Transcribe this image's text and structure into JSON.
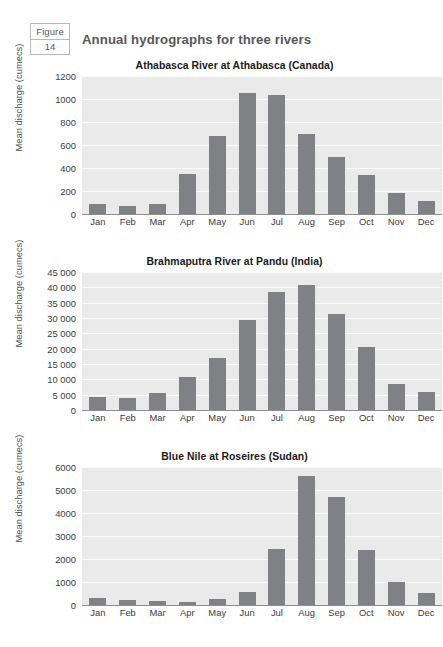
{
  "header": {
    "badge_label": "Figure",
    "badge_number": "14",
    "title": "Annual hydrographs for three rivers"
  },
  "colors": {
    "bar": "#808184",
    "plot_background": "#eaeaea",
    "gridline": "#fbfbfb",
    "axis": "#8d8d8f",
    "page_background": "#ffffff",
    "header_text": "#58585a"
  },
  "chart_data": [
    {
      "type": "bar",
      "title": "Athabasca River at Athabasca (Canada)",
      "xlabel": "",
      "ylabel": "Mean discharge (cumecs)",
      "categories": [
        "Jan",
        "Feb",
        "Mar",
        "Apr",
        "May",
        "Jun",
        "Jul",
        "Aug",
        "Sep",
        "Oct",
        "Nov",
        "Dec"
      ],
      "values": [
        85,
        70,
        90,
        345,
        680,
        1050,
        1035,
        700,
        500,
        340,
        180,
        115
      ],
      "ylim": [
        0,
        1200
      ],
      "yticks": [
        0,
        200,
        400,
        600,
        800,
        1000,
        1200
      ],
      "ytick_labels": [
        "0",
        "200",
        "400",
        "600",
        "800",
        "1000",
        "1200"
      ],
      "grid": true,
      "legend": "none"
    },
    {
      "type": "bar",
      "title": "Brahmaputra River at Pandu (India)",
      "xlabel": "",
      "ylabel": "Mean discharge (cumecs)",
      "categories": [
        "Jan",
        "Feb",
        "Mar",
        "Apr",
        "May",
        "Jun",
        "Jul",
        "Aug",
        "Sep",
        "Oct",
        "Nov",
        "Dec"
      ],
      "values": [
        4200,
        3900,
        5700,
        10700,
        16800,
        29300,
        38500,
        40700,
        31400,
        20500,
        8500,
        6000
      ],
      "ylim": [
        0,
        45000
      ],
      "yticks": [
        0,
        5000,
        10000,
        15000,
        20000,
        25000,
        30000,
        35000,
        40000,
        45000
      ],
      "ytick_labels": [
        "0",
        "5 000",
        "10 000",
        "15 000",
        "20 000",
        "25 000",
        "30 000",
        "35 000",
        "40 000",
        "45 000"
      ],
      "grid": true,
      "legend": "none"
    },
    {
      "type": "bar",
      "title": "Blue Nile at Roseires (Sudan)",
      "xlabel": "",
      "ylabel": "Mean discharge (cumecs)",
      "categories": [
        "Jan",
        "Feb",
        "Mar",
        "Apr",
        "May",
        "Jun",
        "Jul",
        "Aug",
        "Sep",
        "Oct",
        "Nov",
        "Dec"
      ],
      "values": [
        300,
        215,
        165,
        130,
        270,
        580,
        2440,
        5620,
        4710,
        2400,
        990,
        540
      ],
      "ylim": [
        0,
        6000
      ],
      "yticks": [
        0,
        1000,
        2000,
        3000,
        4000,
        5000,
        6000
      ],
      "ytick_labels": [
        "0",
        "1000",
        "2000",
        "3000",
        "4000",
        "5000",
        "6000"
      ],
      "grid": true,
      "legend": "none"
    }
  ]
}
